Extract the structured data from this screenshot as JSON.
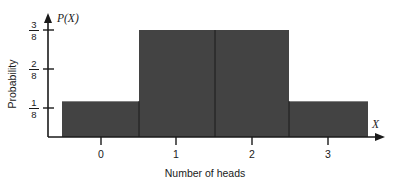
{
  "chart_data": {
    "type": "bar",
    "title": "",
    "subtitle": "",
    "xlabel": "Number of heads",
    "ylabel": "Probability",
    "x_axis_symbol": "X",
    "y_axis_symbol": "P(X)",
    "categories": [
      "0",
      "1",
      "2",
      "3"
    ],
    "values": [
      0.125,
      0.375,
      0.375,
      0.125
    ],
    "value_labels": [
      "1/8",
      "3/8",
      "3/8",
      "1/8"
    ],
    "ytick_labels": [
      "1/8",
      "2/8",
      "3/8"
    ],
    "ytick_numerators": [
      "1",
      "2",
      "3"
    ],
    "ytick_denominators": [
      "8",
      "8",
      "8"
    ],
    "ytick_values": [
      0.125,
      0.25,
      0.375
    ],
    "xtick_labels": [
      "0",
      "1",
      "2",
      "3"
    ],
    "ylim": [
      0,
      0.4375
    ],
    "xlim": [
      -0.6,
      3.7
    ],
    "grid": false,
    "legend": false,
    "legend_position": "none",
    "bars_contiguous": true,
    "bar_color": "#434343",
    "axis_color": "#1a1a1a",
    "background_color": "#ffffff"
  },
  "figure": {
    "caption": ""
  }
}
